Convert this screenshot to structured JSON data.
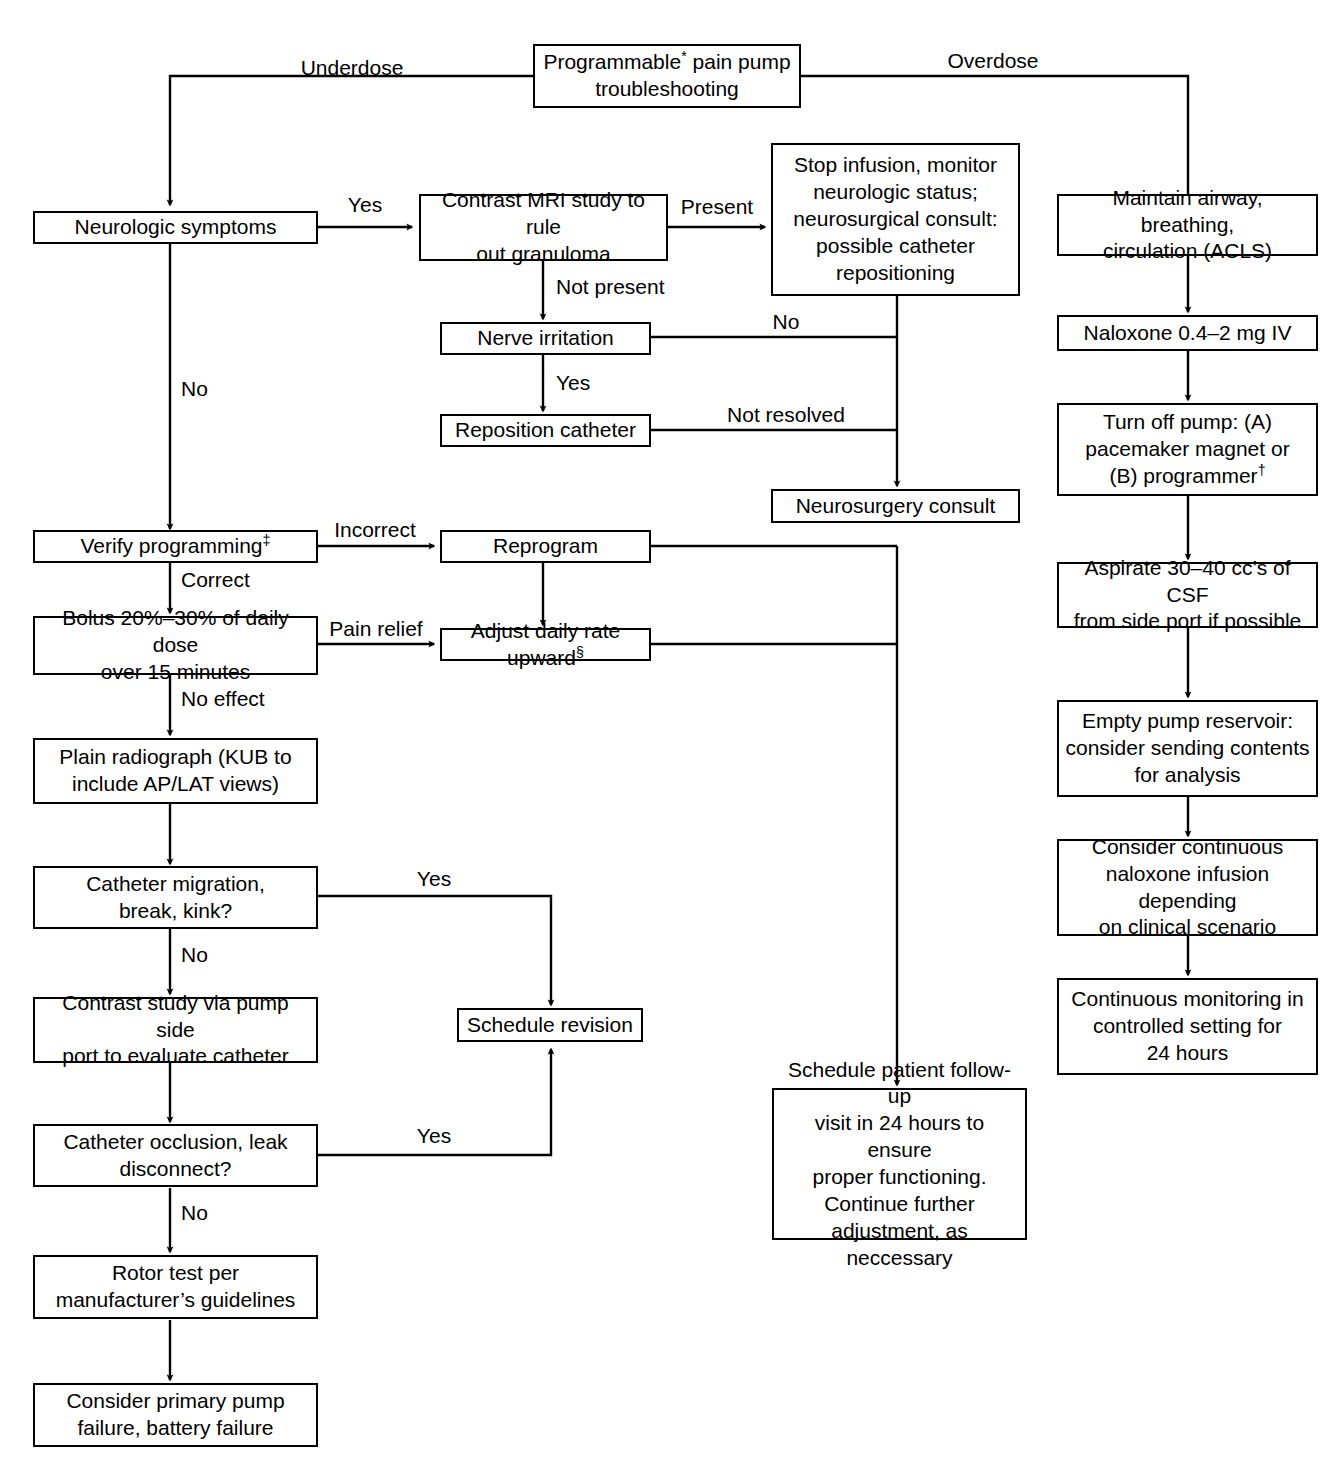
{
  "diagram": {
    "line_color": "#000000",
    "box_fill": "#ffffff",
    "text_color": "#000000"
  },
  "nodes": {
    "root": "Programmable* pain pump\ntroubleshooting",
    "neurologic_symptoms": "Neurologic symptoms",
    "contrast_mri": "Contrast MRI study to rule\nout granuloma",
    "stop_infusion": "Stop infusion, monitor\nneurologic status;\nneurosurgical consult:\npossible catheter\nrepositioning",
    "nerve_irritation": "Nerve irritation",
    "reposition_catheter": "Reposition catheter",
    "neurosurgery_consult": "Neurosurgery consult",
    "verify_programming": "Verify programming‡",
    "reprogram": "Reprogram",
    "bolus": "Bolus 20%–30% of daily dose\nover 15 minutes",
    "adjust_daily_rate": "Adjust daily rate upward§",
    "plain_radiograph": "Plain radiograph (KUB to\ninclude AP/LAT views)",
    "catheter_migration": "Catheter migration,\nbreak, kink?",
    "contrast_study": "Contrast study via pump side\nport to evaluate catheter",
    "schedule_revision": "Schedule revision",
    "catheter_occlusion": "Catheter occlusion, leak\ndisconnect?",
    "rotor_test": "Rotor test per\nmanufacturer’s guidelines",
    "primary_pump_failure": "Consider primary pump\nfailure, battery failure",
    "schedule_followup": "Schedule patient follow-up\nvisit in 24 hours to ensure\nproper functioning.\nContinue further\nadjustment, as neccessary",
    "maintain_airway": "Maintain airway, breathing,\ncirculation (ACLS)",
    "naloxone": "Naloxone 0.4–2 mg IV",
    "turn_off_pump": "Turn off pump: (A)\npacemaker magnet or\n(B) programmer†",
    "aspirate_csf": "Aspirate 30–40 cc’s of CSF\nfrom side port if possible",
    "empty_reservoir": "Empty pump reservoir:\nconsider sending contents\nfor analysis",
    "consider_naloxone_infusion": "Consider continuous\nnaloxone infusion depending\non clinical scenario",
    "continuous_monitoring": "Continuous monitoring in\ncontrolled setting for\n24 hours"
  },
  "edge_labels": {
    "underdose": "Underdose",
    "overdose": "Overdose",
    "neuro_yes": "Yes",
    "neuro_no": "No",
    "granuloma_present": "Present",
    "granuloma_not_present": "Not present",
    "nerve_no": "No",
    "nerve_yes": "Yes",
    "reposition_not_resolved": "Not resolved",
    "verify_incorrect": "Incorrect",
    "verify_correct": "Correct",
    "bolus_pain_relief": "Pain relief",
    "bolus_no_effect": "No effect",
    "migration_yes": "Yes",
    "migration_no": "No",
    "occlusion_yes": "Yes",
    "occlusion_no": "No"
  }
}
